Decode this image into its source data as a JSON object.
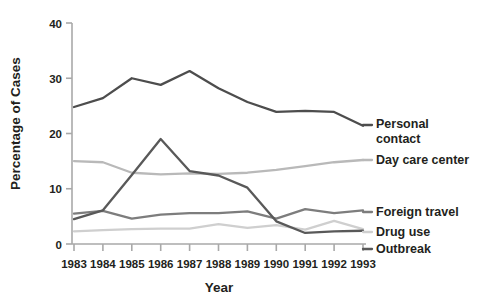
{
  "chart_data": {
    "type": "line",
    "title": "",
    "xlabel": "Year",
    "ylabel": "Percentage of Cases",
    "categories": [
      "1983",
      "1984",
      "1985",
      "1986",
      "1987",
      "1988",
      "1989",
      "1990",
      "1991",
      "1992",
      "1993"
    ],
    "x": [
      1983,
      1984,
      1985,
      1986,
      1987,
      1988,
      1989,
      1990,
      1991,
      1992,
      1993
    ],
    "xlim": [
      1983,
      1993
    ],
    "ylim": [
      0,
      40
    ],
    "ytick_labels": [
      "0",
      "10",
      "20",
      "30",
      "40"
    ],
    "yticks": [
      0,
      10,
      20,
      30,
      40
    ],
    "grid": false,
    "legend_position": "right-inline",
    "series": [
      {
        "name": "Personal contact",
        "color": "#4d4d4d",
        "values": [
          24.8,
          26.4,
          30.0,
          28.8,
          31.3,
          28.2,
          25.7,
          23.9,
          24.1,
          23.9,
          21.4
        ]
      },
      {
        "name": "Day care center",
        "color": "#b9b9b9",
        "values": [
          15.0,
          14.8,
          12.9,
          12.6,
          12.8,
          12.7,
          12.9,
          13.4,
          14.1,
          14.8,
          15.2
        ]
      },
      {
        "name": "Foreign travel",
        "color": "#7d7d7d",
        "values": [
          5.5,
          6.0,
          4.6,
          5.3,
          5.6,
          5.6,
          5.9,
          4.6,
          6.3,
          5.6,
          6.1
        ]
      },
      {
        "name": "Drug use",
        "color": "#cfcfcf",
        "values": [
          2.3,
          2.5,
          2.7,
          2.8,
          2.8,
          3.6,
          2.9,
          3.4,
          2.6,
          4.2,
          2.7
        ]
      },
      {
        "name": "Outbreak",
        "color": "#595959",
        "values": [
          4.5,
          6.1,
          12.5,
          19.0,
          13.2,
          12.4,
          10.2,
          4.1,
          2.0,
          2.3,
          2.4
        ]
      }
    ],
    "legend_entries": [
      {
        "label_line1": "Personal",
        "label_line2": "contact",
        "label_full": "Personal contact"
      },
      {
        "label_line1": "Day care center",
        "label_line2": "",
        "label_full": "Day care center"
      },
      {
        "label_line1": "Foreign travel",
        "label_line2": "",
        "label_full": "Foreign travel"
      },
      {
        "label_line1": "Drug use",
        "label_line2": "",
        "label_full": "Drug use"
      },
      {
        "label_line1": "Outbreak",
        "label_line2": "",
        "label_full": "Outbreak"
      }
    ]
  }
}
